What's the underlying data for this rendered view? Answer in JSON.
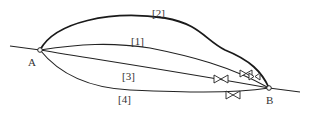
{
  "diagram": {
    "type": "parallel-pipe-network",
    "nodes": [
      {
        "id": "A",
        "label": "A"
      },
      {
        "id": "B",
        "label": "B"
      }
    ],
    "paths": [
      {
        "id": "1",
        "label": "[1]",
        "valves": 2
      },
      {
        "id": "2",
        "label": "[2]",
        "valves": 0
      },
      {
        "id": "3",
        "label": "[3]",
        "valves": 1
      },
      {
        "id": "4",
        "label": "[4]",
        "valves": 1
      }
    ],
    "colors": {
      "stroke": "#222222",
      "background": "#ffffff",
      "text": "#333333"
    }
  }
}
